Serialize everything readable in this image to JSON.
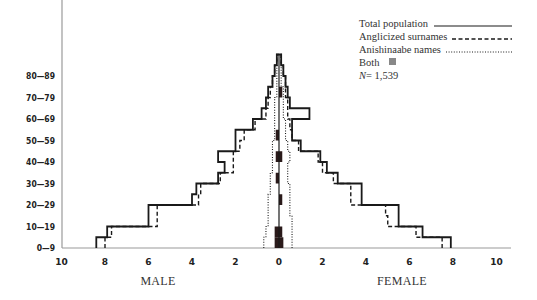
{
  "chart_data": {
    "type": "population-pyramid",
    "title": "",
    "xlabel_left": "MALE",
    "xlabel_right": "FEMALE",
    "x_ticks_left": [
      "10",
      "8",
      "6",
      "4",
      "2",
      "0"
    ],
    "x_ticks_right": [
      "2",
      "4",
      "6",
      "8",
      "10"
    ],
    "xlim": [
      0,
      10
    ],
    "age_labels": [
      "0—9",
      "10—19",
      "20—29",
      "30—39",
      "40—49",
      "50—59",
      "60—69",
      "70—79",
      "80—89"
    ],
    "bins_5yr": [
      "0-4",
      "5-9",
      "10-14",
      "15-19",
      "20-24",
      "25-29",
      "30-34",
      "35-39",
      "40-44",
      "45-49",
      "50-54",
      "55-59",
      "60-64",
      "65-69",
      "70-74",
      "75-79",
      "80-84",
      "85-89"
    ],
    "legend": [
      {
        "label": "Total population",
        "style": "solid"
      },
      {
        "label": "Anglicized surnames",
        "style": "dashed"
      },
      {
        "label": "Anishinaabe names",
        "style": "dotted"
      },
      {
        "label": "Both",
        "style": "filled-square"
      }
    ],
    "n_label": "N",
    "n_value": "= 1,539",
    "series": [
      {
        "name": "Total population",
        "style": "solid",
        "male": [
          8.4,
          7.9,
          6.0,
          6.0,
          4.0,
          3.8,
          2.8,
          2.5,
          2.8,
          2.0,
          2.0,
          1.2,
          0.8,
          0.6,
          0.5,
          0.3,
          0.2,
          0.1
        ],
        "female": [
          7.9,
          6.6,
          5.5,
          5.5,
          3.8,
          3.8,
          2.7,
          2.2,
          1.9,
          1.0,
          0.6,
          0.6,
          1.4,
          0.5,
          0.4,
          0.3,
          0.2,
          0.1
        ]
      },
      {
        "name": "Anglicized surnames",
        "style": "dashed",
        "male": [
          8.0,
          7.7,
          5.6,
          5.6,
          3.7,
          3.6,
          2.7,
          2.1,
          2.1,
          1.8,
          1.6,
          1.1,
          0.6,
          0.5,
          0.4,
          0.3,
          0.2,
          0.1
        ],
        "female": [
          7.5,
          6.3,
          5.0,
          4.9,
          3.3,
          3.3,
          2.5,
          2.0,
          1.8,
          0.9,
          0.6,
          0.5,
          0.4,
          0.4,
          0.3,
          0.3,
          0.2,
          0.1
        ]
      },
      {
        "name": "Anishinaabe names",
        "style": "dotted",
        "male": [
          0.7,
          0.6,
          0.5,
          0.5,
          0.5,
          0.4,
          0.4,
          0.3,
          0.3,
          0.3,
          0.2,
          0.2,
          0.2,
          0.2,
          0.1,
          0.1,
          0.1,
          0.1
        ],
        "female": [
          0.6,
          0.6,
          0.6,
          0.5,
          0.5,
          0.5,
          0.4,
          0.4,
          0.5,
          0.4,
          0.3,
          0.3,
          0.2,
          0.2,
          0.2,
          0.1,
          0.1,
          0.1
        ]
      },
      {
        "name": "Both",
        "style": "filled",
        "male": [
          0.2,
          0.2,
          0.0,
          0.0,
          0.0,
          0.0,
          0.15,
          0.0,
          0.15,
          0.0,
          0.15,
          0.0,
          0.0,
          0.0,
          0.0,
          0.0,
          0.0,
          0.0
        ],
        "female": [
          0.2,
          0.15,
          0.0,
          0.0,
          0.15,
          0.0,
          0.0,
          0.0,
          0.15,
          0.0,
          0.0,
          0.0,
          0.0,
          0.0,
          0.15,
          0.0,
          0.0,
          0.0
        ]
      }
    ],
    "grid": false,
    "legend_position": "top-right"
  },
  "colors": {
    "line": "#1a1a1a",
    "axis": "#888888",
    "both_fill": "#2a1a1a"
  }
}
